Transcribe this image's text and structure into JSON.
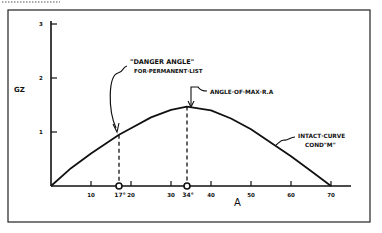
{
  "chart_data": {
    "type": "line",
    "title": "",
    "xlabel": "A",
    "ylabel": "GZ",
    "xlim": [
      0,
      70
    ],
    "ylim": [
      0,
      3
    ],
    "x_ticks": [
      10,
      20,
      30,
      40,
      50,
      60,
      70
    ],
    "x_tick_labels": [
      "10",
      "20",
      "30",
      "40",
      "50",
      "60",
      "70"
    ],
    "y_ticks": [
      1,
      2,
      3
    ],
    "y_tick_labels": [
      "1",
      "2",
      "3"
    ],
    "series": [
      {
        "name": "Intact curve cond \"M\"",
        "x": [
          0,
          5,
          10,
          17,
          20,
          25,
          30,
          34,
          40,
          45,
          50,
          55,
          60,
          65,
          70
        ],
        "y": [
          0,
          0.33,
          0.6,
          0.95,
          1.07,
          1.27,
          1.41,
          1.47,
          1.4,
          1.25,
          1.05,
          0.8,
          0.55,
          0.28,
          0
        ]
      }
    ],
    "markers": [
      {
        "x": 17,
        "label": "17°",
        "y_on_curve": 0.95
      },
      {
        "x": 34,
        "label": "34°",
        "y_on_curve": 1.47
      }
    ],
    "annotations": [
      {
        "text_line1": "\"DANGER ANGLE\"",
        "text_line2": "FOR·PERMANENT·LIST",
        "target_x": 17
      },
      {
        "text_line1": "ANGLE·OF·MAX·R.A",
        "target_x": 34
      },
      {
        "text_line1": "INTACT·CURVE",
        "text_line2": "COND\"M\""
      }
    ],
    "grid": false,
    "legend": "none"
  }
}
